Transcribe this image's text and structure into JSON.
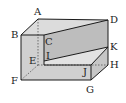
{
  "diagram": {
    "type": "solid-geometry",
    "colors": {
      "stroke": "#1a1a1a",
      "face_top": "#dcdcdc",
      "face_front": "#cfcfcf",
      "face_side": "#c4c4c4",
      "face_inner": "#b9b9b9",
      "hidden": "#444444"
    },
    "vertices": {
      "A": {
        "label": "A"
      },
      "B": {
        "label": "B"
      },
      "C": {
        "label": "C"
      },
      "D": {
        "label": "D"
      },
      "E": {
        "label": "E"
      },
      "F": {
        "label": "F"
      },
      "G": {
        "label": "G"
      },
      "H": {
        "label": "H"
      },
      "I": {
        "label": "I"
      },
      "J": {
        "label": "J"
      },
      "K": {
        "label": "K"
      }
    }
  }
}
